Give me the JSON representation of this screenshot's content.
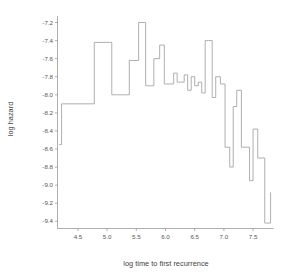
{
  "chart_data": {
    "type": "line",
    "subtype": "step",
    "title": "",
    "xlabel": "log time to first recurrence",
    "ylabel": "log hazard",
    "xlim": [
      4.15,
      7.85
    ],
    "ylim": [
      -9.48,
      -7.15
    ],
    "grid": false,
    "legend": null,
    "xticks": [
      4.5,
      5.0,
      5.5,
      6.0,
      6.5,
      7.0,
      7.5
    ],
    "xtick_labels": [
      "4.5",
      "5.0",
      "5.5",
      "6.0",
      "6.5",
      "7.0",
      "7.5"
    ],
    "yticks": [
      -7.2,
      -7.4,
      -7.6,
      -7.8,
      -8.0,
      -8.2,
      -8.4,
      -8.6,
      -8.8,
      -9.0,
      -9.2,
      -9.4
    ],
    "ytick_labels": [
      "-7.2",
      "-7.4",
      "-7.6",
      "-7.8",
      "-8.0",
      "-8.2",
      "-8.4",
      "-8.6",
      "-8.8",
      "-9.0",
      "-9.2",
      "-9.4"
    ],
    "series": [
      {
        "name": "log hazard",
        "color": "#9a9a9a",
        "step_edges": [
          4.18,
          4.22,
          4.62,
          4.78,
          5.08,
          5.3,
          5.38,
          5.44,
          5.54,
          5.66,
          5.74,
          5.8,
          5.9,
          5.98,
          6.06,
          6.14,
          6.2,
          6.26,
          6.32,
          6.38,
          6.44,
          6.5,
          6.56,
          6.62,
          6.68,
          6.74,
          6.8,
          6.86,
          6.94,
          7.02,
          7.1,
          7.16,
          7.22,
          7.3,
          7.38,
          7.44,
          7.5,
          7.58,
          7.7,
          7.8
        ],
        "step_values": [
          -8.55,
          -8.1,
          -8.1,
          -7.42,
          -8.0,
          -8.0,
          -7.62,
          -7.62,
          -7.2,
          -7.9,
          -7.9,
          -7.6,
          -7.45,
          -7.88,
          -7.88,
          -7.76,
          -7.86,
          -7.86,
          -7.78,
          -7.95,
          -7.8,
          -7.9,
          -7.86,
          -7.98,
          -7.4,
          -7.4,
          -8.03,
          -7.8,
          -7.88,
          -8.58,
          -8.8,
          -8.13,
          -7.95,
          -8.58,
          -8.58,
          -8.95,
          -8.38,
          -8.7,
          -9.42,
          -9.08
        ]
      }
    ]
  },
  "axes": {
    "y_title": "log hazard",
    "x_title": "log time to first recurrence"
  }
}
